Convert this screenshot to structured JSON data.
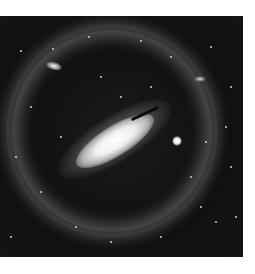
{
  "image": {
    "subject": "spiral galaxy inside luminous ring halo",
    "colors": {
      "background": "#ffffff",
      "sky": "#121212",
      "core": "#ffffff",
      "halo": "#8a8a8a"
    },
    "stars": [
      [
        20,
        34
      ],
      [
        52,
        32
      ],
      [
        88,
        20
      ],
      [
        140,
        24
      ],
      [
        170,
        40
      ],
      [
        210,
        30
      ],
      [
        230,
        70
      ],
      [
        225,
        110
      ],
      [
        205,
        125
      ],
      [
        200,
        190
      ],
      [
        215,
        205
      ],
      [
        30,
        90
      ],
      [
        15,
        140
      ],
      [
        40,
        175
      ],
      [
        75,
        210
      ],
      [
        110,
        225
      ],
      [
        160,
        220
      ],
      [
        190,
        160
      ],
      [
        60,
        120
      ],
      [
        100,
        60
      ],
      [
        120,
        80
      ],
      [
        150,
        70
      ],
      [
        235,
        200
      ],
      [
        10,
        220
      ],
      [
        230,
        150
      ]
    ]
  }
}
